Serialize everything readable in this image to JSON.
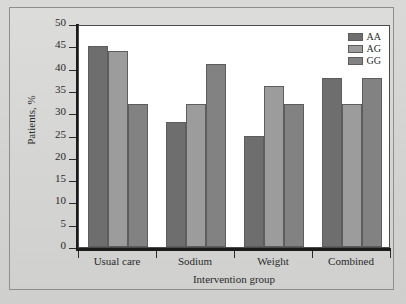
{
  "chart_data": {
    "type": "bar",
    "title": "",
    "subtitle": "",
    "xlabel": "Intervention group",
    "ylabel": "Patients, %",
    "categories": [
      "Usual care",
      "Sodium",
      "Weight",
      "Combined"
    ],
    "series": [
      {
        "name": "AA",
        "values": [
          45,
          28,
          25,
          38
        ],
        "color": "#6e6e6e"
      },
      {
        "name": "AG",
        "values": [
          44,
          32,
          36,
          32
        ],
        "color": "#9c9c9c"
      },
      {
        "name": "GG",
        "values": [
          32,
          41,
          32,
          38
        ],
        "color": "#828282"
      }
    ],
    "ylim": [
      0,
      50
    ],
    "ytick_step": 5,
    "yticks": [
      0,
      5,
      10,
      15,
      20,
      25,
      30,
      35,
      40,
      45,
      50
    ],
    "ytick_labels": [
      "0",
      "5",
      "10",
      "15",
      "20",
      "25",
      "30",
      "35",
      "40",
      "45",
      "50"
    ],
    "grid": false,
    "legend_position": "top-right",
    "legend_entries": [
      "AA",
      "AG",
      "GG"
    ],
    "bar_edge_color": "#5d5d5d",
    "axis_color": "#1b1b1b",
    "plot_background": "#ffffff",
    "figure_background": "#d5d5d3"
  }
}
